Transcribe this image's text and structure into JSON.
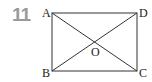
{
  "problem_number": "11",
  "diagram": {
    "shape": "rectangle",
    "vertices": {
      "A": {
        "x": 52,
        "y": 13
      },
      "D": {
        "x": 137,
        "y": 13
      },
      "C": {
        "x": 137,
        "y": 71
      },
      "B": {
        "x": 52,
        "y": 71
      }
    },
    "diagonals": [
      "AC",
      "BD"
    ],
    "intersection": {
      "label": "O",
      "x": 94.5,
      "y": 42
    },
    "labels": {
      "A": "A",
      "B": "B",
      "C": "C",
      "D": "D",
      "O": "O"
    },
    "line_color": "#333333"
  }
}
